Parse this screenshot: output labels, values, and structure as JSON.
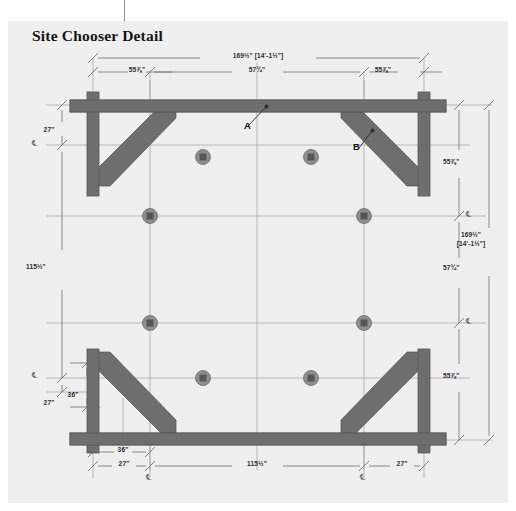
{
  "title": "Site Chooser Detail",
  "colors": {
    "panel_background": "#efefef",
    "page_background": "#ffffff",
    "timber": "#6e6e6e",
    "timber_edge": "#5a5a5a",
    "gridline": "#9a9a9a",
    "dimension_line": "#7d7d7d",
    "text": "#2b2b2b",
    "post_marker_ring": "#8e8e8e",
    "post_marker_core": "#5e5e5e"
  },
  "centerline_symbol": "℄",
  "dimensions": {
    "top": {
      "overall": "169½\" [14'-1½\"]",
      "segments": [
        "55⅞\"",
        "57¾\"",
        "55⅞\""
      ]
    },
    "bottom": {
      "upper_row": [
        "36\""
      ],
      "lower_row": [
        "27\"",
        "115½\"",
        "27\""
      ],
      "centerline_labels": [
        "℄",
        "℄"
      ]
    },
    "left": {
      "top_offset": "27\"",
      "span": "115½\"",
      "bottom_offset": "27\"",
      "inner_offset": "36\"",
      "centerline_labels": [
        "℄",
        "℄"
      ]
    },
    "right": {
      "overall": "169½\"\n[14'-1½\"]",
      "overall_line1": "169½\"",
      "overall_line2": "[14'-1½\"]",
      "segments": [
        "55⅞\"",
        "57¾\"",
        "55⅞\""
      ],
      "centerline_labels": [
        "℄",
        "℄",
        "℄"
      ]
    }
  },
  "callouts": [
    {
      "label": "A",
      "target": "top-beam"
    },
    {
      "label": "B",
      "target": "diagonal-brace"
    }
  ],
  "post_markers": {
    "count": 8,
    "note": "column base markers at grid intersections"
  }
}
